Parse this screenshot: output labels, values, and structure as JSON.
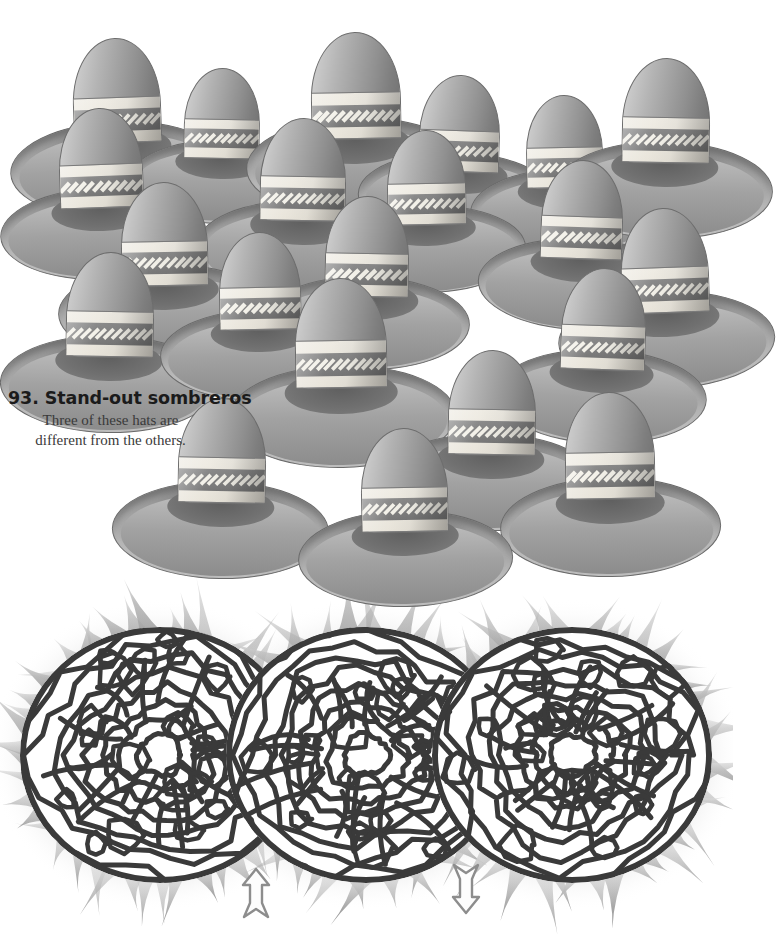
{
  "page": {
    "background_color": "#ffffff",
    "width": 733,
    "height": 952
  },
  "puzzle_sombreros": {
    "number": "93.",
    "title": "93. Stand-out sombreros",
    "subtitle_line1": "Three of these hats are",
    "subtitle_line2": "different from the others.",
    "subtitle": "Three of these hats are different from the others.",
    "hat_count": 21,
    "odd_one_out_count": 3,
    "colors": {
      "brim_dark": "#6e6e6e",
      "brim_light": "#a8a8a8",
      "crown_highlight": "#d5d5d5",
      "crown_shadow": "#6f6f6f",
      "band_cream": "#efece4",
      "band_stripe": "#8b8b8b",
      "diamond": "#f3f1e9",
      "outline": "#6d6d6d"
    },
    "hats": [
      {
        "id": "hat-01",
        "x": 10,
        "y": 38,
        "scale": 1.0,
        "rot": -2,
        "diamonds": 11
      },
      {
        "id": "hat-02",
        "x": 128,
        "y": 68,
        "scale": 0.86,
        "rot": 1,
        "diamonds": 10
      },
      {
        "id": "hat-03",
        "x": 246,
        "y": 32,
        "scale": 1.02,
        "rot": -1,
        "diamonds": 11
      },
      {
        "id": "hat-04",
        "x": 358,
        "y": 75,
        "scale": 0.92,
        "rot": 2,
        "diamonds": 10
      },
      {
        "id": "hat-05",
        "x": 470,
        "y": 95,
        "scale": 0.88,
        "rot": -1,
        "diamonds": 10
      },
      {
        "id": "hat-06",
        "x": 556,
        "y": 58,
        "scale": 1.0,
        "rot": 1,
        "diamonds": 11
      },
      {
        "id": "hat-07",
        "x": 0,
        "y": 108,
        "scale": 0.95,
        "rot": -2,
        "diamonds": 10
      },
      {
        "id": "hat-08",
        "x": 196,
        "y": 118,
        "scale": 0.98,
        "rot": 1,
        "diamonds": 11
      },
      {
        "id": "hat-09",
        "x": 330,
        "y": 130,
        "scale": 0.9,
        "rot": -1,
        "diamonds": 10
      },
      {
        "id": "hat-10",
        "x": 478,
        "y": 160,
        "scale": 0.94,
        "rot": 2,
        "diamonds": 10
      },
      {
        "id": "hat-11",
        "x": 58,
        "y": 182,
        "scale": 0.99,
        "rot": -1,
        "diamonds": 11
      },
      {
        "id": "hat-12",
        "x": 262,
        "y": 196,
        "scale": 0.96,
        "rot": 1,
        "diamonds": 10
      },
      {
        "id": "hat-13",
        "x": 558,
        "y": 208,
        "scale": 1.0,
        "rot": -2,
        "diamonds": 11
      },
      {
        "id": "hat-14",
        "x": 0,
        "y": 252,
        "scale": 1.0,
        "rot": 1,
        "diamonds": 11
      },
      {
        "id": "hat-15",
        "x": 160,
        "y": 232,
        "scale": 0.93,
        "rot": -1,
        "diamonds": 10
      },
      {
        "id": "hat-16",
        "x": 496,
        "y": 268,
        "scale": 0.97,
        "rot": 2,
        "diamonds": 11
      },
      {
        "id": "hat-17",
        "x": 228,
        "y": 278,
        "scale": 1.05,
        "rot": -1,
        "diamonds": 12
      },
      {
        "id": "hat-18",
        "x": 382,
        "y": 350,
        "scale": 1.0,
        "rot": 1,
        "diamonds": 11
      },
      {
        "id": "hat-19",
        "x": 500,
        "y": 392,
        "scale": 1.02,
        "rot": -1,
        "diamonds": 11
      },
      {
        "id": "hat-20",
        "x": 112,
        "y": 398,
        "scale": 1.0,
        "rot": 1,
        "diamonds": 11
      },
      {
        "id": "hat-21",
        "x": 298,
        "y": 428,
        "scale": 0.99,
        "rot": -1,
        "diamonds": 11
      }
    ]
  },
  "puzzle_maze": {
    "type": "organic-labyrinth",
    "lobe_count": 3,
    "entrance_marker": "up-arrow",
    "exit_marker": "down-arrow",
    "entrance_x": 256,
    "exit_x": 466,
    "colors": {
      "path_stroke": "#3a3a3a",
      "path_fill": "#ffffff",
      "flame_light": "#cfcfcf",
      "flame_dark": "#8c8c8c",
      "arrow_stroke": "#8d8d8d",
      "arrow_fill": "#fdfdfd"
    },
    "lobes": [
      {
        "id": "lobe-left",
        "cx": 160,
        "cy": 180,
        "rx": 140,
        "ry": 128
      },
      {
        "id": "lobe-center",
        "cx": 366,
        "cy": 180,
        "rx": 140,
        "ry": 128
      },
      {
        "id": "lobe-right",
        "cx": 572,
        "cy": 180,
        "rx": 140,
        "ry": 128
      }
    ]
  }
}
